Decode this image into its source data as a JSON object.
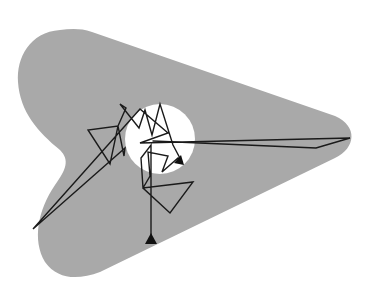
{
  "diagram": {
    "width": 378,
    "height": 291,
    "colors": {
      "background": "#ffffff",
      "region_fill": "#a9a9a9",
      "circle_fill": "#ffffff",
      "path_stroke": "#1a1a1a",
      "marker_fill": "#111111"
    },
    "region": {
      "shape": "rounded-arrowhead",
      "path": "M 60 30 C 30 32 16 58 18 82 C 20 112 38 132 60 150 C 70 160 66 170 55 185 C 38 210 32 240 45 262 C 58 280 78 280 100 272 L 335 158 C 356 148 358 126 335 116 L 92 32 C 80 28 70 29 60 30 Z"
    },
    "circle": {
      "cx": 160,
      "cy": 139,
      "r": 35
    },
    "trajectory": {
      "points": [
        [
          151,
          242
        ],
        [
          151,
          145
        ],
        [
          141,
          158
        ],
        [
          143,
          188
        ],
        [
          193,
          182
        ],
        [
          170,
          213
        ],
        [
          143,
          188
        ],
        [
          150,
          176
        ],
        [
          148,
          152
        ],
        [
          168,
          156
        ],
        [
          162,
          172
        ],
        [
          178,
          158
        ],
        [
          182,
          162
        ],
        [
          173,
          145
        ],
        [
          160,
          104
        ],
        [
          152,
          135
        ],
        [
          145,
          110
        ],
        [
          139,
          128
        ],
        [
          120,
          104
        ],
        [
          126,
          108
        ],
        [
          118,
          126
        ],
        [
          110,
          164
        ],
        [
          88,
          130
        ],
        [
          118,
          126
        ],
        [
          124,
          156
        ],
        [
          125,
          148
        ],
        [
          33,
          229
        ],
        [
          140,
          109
        ],
        [
          168,
          133
        ],
        [
          140,
          143
        ],
        [
          350,
          138
        ],
        [
          316,
          148
        ],
        [
          153,
          141
        ]
      ],
      "start_marker": {
        "shape": "triangle",
        "x": 151,
        "y": 242
      },
      "end_marker": {
        "shape": "arrowhead",
        "x": 184,
        "y": 165
      }
    }
  }
}
